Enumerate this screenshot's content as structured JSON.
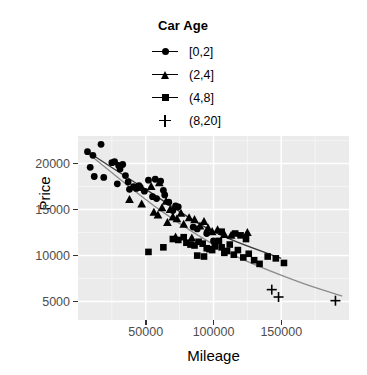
{
  "chart_data": {
    "type": "scatter",
    "title": "",
    "xlabel": "Mileage",
    "ylabel": "Price",
    "xlim": [
      0,
      200000
    ],
    "ylim": [
      3000,
      23000
    ],
    "xticks": [
      50000,
      100000,
      150000
    ],
    "xtick_labels": [
      "50000",
      "100000",
      "150000"
    ],
    "yticks": [
      5000,
      10000,
      15000,
      20000
    ],
    "ytick_labels": [
      "5000",
      "10000",
      "15000",
      "20000"
    ],
    "grid": true,
    "legend": {
      "title": "Car Age",
      "position": "top",
      "entries": [
        {
          "label": "[0,2]",
          "shape": "circle",
          "color": "#000000"
        },
        {
          "label": "(2,4]",
          "shape": "triangle",
          "color": "#000000"
        },
        {
          "label": "(4,8]",
          "shape": "square",
          "color": "#000000"
        },
        {
          "label": "(8,20]",
          "shape": "plus",
          "color": "#000000"
        }
      ]
    },
    "series": [
      {
        "name": "[0,2]",
        "shape": "circle",
        "points": [
          [
            7000,
            21300
          ],
          [
            11000,
            20900
          ],
          [
            9000,
            19600
          ],
          [
            17000,
            22100
          ],
          [
            12000,
            18600
          ],
          [
            19000,
            18500
          ],
          [
            25000,
            20100
          ],
          [
            27000,
            20200
          ],
          [
            30000,
            19800
          ],
          [
            31000,
            19400
          ],
          [
            33000,
            19900
          ],
          [
            35000,
            18700
          ],
          [
            29000,
            17800
          ],
          [
            37000,
            18000
          ],
          [
            38000,
            17200
          ],
          [
            41000,
            17500
          ],
          [
            43000,
            17300
          ],
          [
            45000,
            17600
          ],
          [
            46000,
            17400
          ],
          [
            49000,
            17000
          ],
          [
            52000,
            18200
          ],
          [
            57000,
            18300
          ],
          [
            61000,
            18100
          ],
          [
            63000,
            17100
          ],
          [
            55000,
            16400
          ],
          [
            58000,
            16200
          ],
          [
            64000,
            16600
          ],
          [
            67000,
            15800
          ],
          [
            72000,
            15400
          ],
          [
            74000,
            15300
          ],
          [
            70000,
            14900
          ],
          [
            85000,
            13100
          ],
          [
            88000,
            12900
          ],
          [
            95000,
            12400
          ],
          [
            100000,
            11600
          ]
        ]
      },
      {
        "name": "(2,4]",
        "shape": "triangle",
        "points": [
          [
            38000,
            16100
          ],
          [
            47000,
            15600
          ],
          [
            54000,
            17500
          ],
          [
            60000,
            17900
          ],
          [
            62000,
            15200
          ],
          [
            65000,
            15900
          ],
          [
            68000,
            15000
          ],
          [
            56000,
            14700
          ],
          [
            59000,
            14400
          ],
          [
            70000,
            14200
          ],
          [
            73000,
            14000
          ],
          [
            76000,
            14600
          ],
          [
            66000,
            13600
          ],
          [
            78000,
            13400
          ],
          [
            82000,
            14100
          ],
          [
            86000,
            13900
          ],
          [
            90000,
            13200
          ],
          [
            93000,
            13700
          ],
          [
            96000,
            13000
          ],
          [
            99000,
            12600
          ],
          [
            103000,
            12800
          ],
          [
            108000,
            12300
          ],
          [
            113000,
            12200
          ],
          [
            125000,
            12500
          ],
          [
            84000,
            11900
          ],
          [
            72000,
            12000
          ]
        ]
      },
      {
        "name": "(4,8]",
        "shape": "square",
        "points": [
          [
            52000,
            10400
          ],
          [
            63000,
            10900
          ],
          [
            70000,
            11800
          ],
          [
            74000,
            11700
          ],
          [
            78000,
            12000
          ],
          [
            80000,
            11400
          ],
          [
            83000,
            11200
          ],
          [
            86000,
            11100
          ],
          [
            89000,
            11500
          ],
          [
            92000,
            11300
          ],
          [
            95000,
            10800
          ],
          [
            97000,
            10700
          ],
          [
            99000,
            10600
          ],
          [
            101000,
            11000
          ],
          [
            104000,
            11600
          ],
          [
            106000,
            10900
          ],
          [
            108000,
            10300
          ],
          [
            110000,
            10500
          ],
          [
            112000,
            11200
          ],
          [
            115000,
            10100
          ],
          [
            118000,
            10600
          ],
          [
            122000,
            9800
          ],
          [
            126000,
            10200
          ],
          [
            130000,
            9500
          ],
          [
            134000,
            9100
          ],
          [
            140000,
            9900
          ],
          [
            146000,
            9700
          ],
          [
            152000,
            9200
          ],
          [
            88000,
            10000
          ],
          [
            93000,
            9900
          ],
          [
            116000,
            12400
          ],
          [
            120000,
            12200
          ],
          [
            124000,
            11800
          ],
          [
            106000,
            12600
          ]
        ]
      },
      {
        "name": "(8,20]",
        "shape": "plus",
        "points": [
          [
            143000,
            6300
          ],
          [
            148000,
            5500
          ],
          [
            190000,
            5100
          ]
        ]
      }
    ],
    "fit_lines": [
      {
        "name": "dark-fit-line",
        "color": "#3a3a3a",
        "points": [
          [
            8000,
            21200
          ],
          [
            50000,
            17200
          ],
          [
            100000,
            12600
          ],
          [
            150000,
            9700
          ]
        ]
      },
      {
        "name": "grey-fit-line",
        "color": "#8c8c8c",
        "points": [
          [
            10000,
            20800
          ],
          [
            60000,
            15000
          ],
          [
            110000,
            10400
          ],
          [
            160000,
            7300
          ],
          [
            195000,
            5600
          ]
        ]
      }
    ]
  },
  "axis": {
    "ylabel": "Price",
    "xlabel": "Mileage"
  }
}
